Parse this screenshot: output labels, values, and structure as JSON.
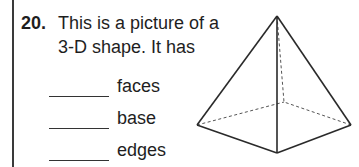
{
  "question": {
    "number": "20.",
    "prompt_line1": "This is a picture of a",
    "prompt_line2": "3-D shape. It has",
    "blanks": [
      {
        "label": "faces"
      },
      {
        "label": "base"
      },
      {
        "label": "edges"
      }
    ]
  },
  "figure": {
    "shape": "square pyramid",
    "stroke_color": "#2a2a2a",
    "hidden_edge_color": "#555555"
  }
}
